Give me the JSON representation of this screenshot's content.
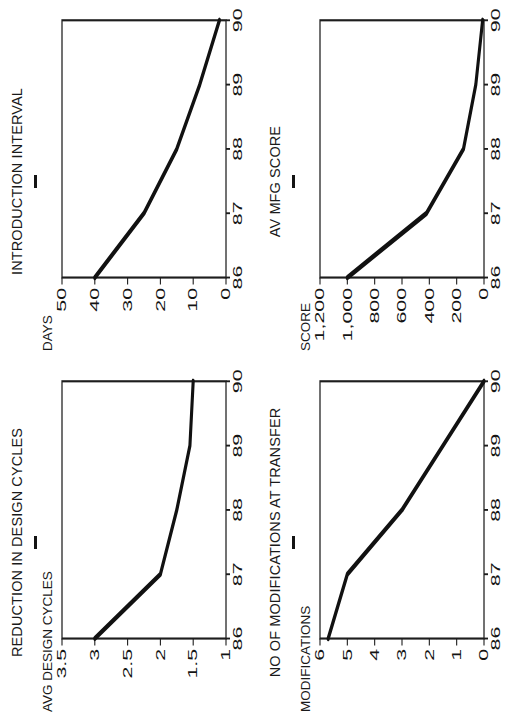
{
  "figure": {
    "rotation_note": "page printed rotated 90 degrees counter-clockwise",
    "title_rule_color": "#141414",
    "line_color": "#111111",
    "axis_color": "#1d1d1d",
    "background": "#ffffff"
  },
  "panels": [
    {
      "id": "reduction-in-design-cycles",
      "title": "REDUCTION IN DESIGN CYCLES",
      "axis_title": "AVG DESIGN CYCLES"
    },
    {
      "id": "introduction-interval",
      "title": "INTRODUCTION INTERVAL",
      "axis_title": "DAYS"
    },
    {
      "id": "no-of-modifications-at-transfer",
      "title": "NO OF MODIFICATIONS AT TRANSFER",
      "axis_title": "MODIFICATIONS"
    },
    {
      "id": "av-mfg-score",
      "title": "AV MFG SCORE",
      "axis_title": "SCORE"
    }
  ],
  "chart_data": [
    {
      "type": "line",
      "title": "REDUCTION IN DESIGN CYCLES",
      "xlabel": "",
      "ylabel": "AVG DESIGN CYCLES",
      "x": [
        86,
        87,
        88,
        89,
        90
      ],
      "xtick_labels": [
        "86",
        "87",
        "88",
        "89",
        "90"
      ],
      "values": [
        3.0,
        2.0,
        1.75,
        1.55,
        1.5
      ],
      "ytick_labels": [
        "3.5",
        "3",
        "2.5",
        "2",
        "1.5",
        "1"
      ],
      "yticks": [
        3.5,
        3,
        2.5,
        2,
        1.5,
        1
      ],
      "ylim": [
        1,
        3.5
      ],
      "xlim": [
        86,
        90
      ],
      "grid": false,
      "legend": "none"
    },
    {
      "type": "line",
      "title": "INTRODUCTION INTERVAL",
      "xlabel": "",
      "ylabel": "DAYS",
      "x": [
        86,
        87,
        88,
        89,
        90
      ],
      "xtick_labels": [
        "86",
        "87",
        "88",
        "89",
        "90"
      ],
      "values": [
        40,
        25,
        15,
        8,
        2
      ],
      "ytick_labels": [
        "50",
        "40",
        "30",
        "20",
        "10",
        "0"
      ],
      "yticks": [
        50,
        40,
        30,
        20,
        10,
        0
      ],
      "ylim": [
        0,
        50
      ],
      "xlim": [
        86,
        90
      ],
      "grid": false,
      "legend": "none"
    },
    {
      "type": "line",
      "title": "NO OF MODIFICATIONS AT TRANSFER",
      "xlabel": "",
      "ylabel": "MODIFICATIONS",
      "x": [
        86,
        87,
        88,
        89,
        90
      ],
      "xtick_labels": [
        "86",
        "87",
        "88",
        "89",
        "90"
      ],
      "values": [
        5.7,
        5.0,
        3.0,
        1.5,
        0.0
      ],
      "ytick_labels": [
        "6",
        "5",
        "4",
        "3",
        "2",
        "1",
        "0"
      ],
      "yticks": [
        6,
        5,
        4,
        3,
        2,
        1,
        0
      ],
      "ylim": [
        0,
        6
      ],
      "xlim": [
        86,
        90
      ],
      "grid": false,
      "legend": "none"
    },
    {
      "type": "line",
      "title": "AV MFG SCORE",
      "xlabel": "",
      "ylabel": "SCORE",
      "x": [
        86,
        87,
        88,
        89,
        90
      ],
      "xtick_labels": [
        "86",
        "87",
        "88",
        "89",
        "90"
      ],
      "values": [
        1000,
        420,
        150,
        60,
        10
      ],
      "ytick_labels": [
        "1,200",
        "1,000",
        "800",
        "600",
        "400",
        "200",
        "0"
      ],
      "yticks": [
        1200,
        1000,
        800,
        600,
        400,
        200,
        0
      ],
      "ylim": [
        0,
        1200
      ],
      "xlim": [
        86,
        90
      ],
      "grid": false,
      "legend": "none"
    }
  ]
}
